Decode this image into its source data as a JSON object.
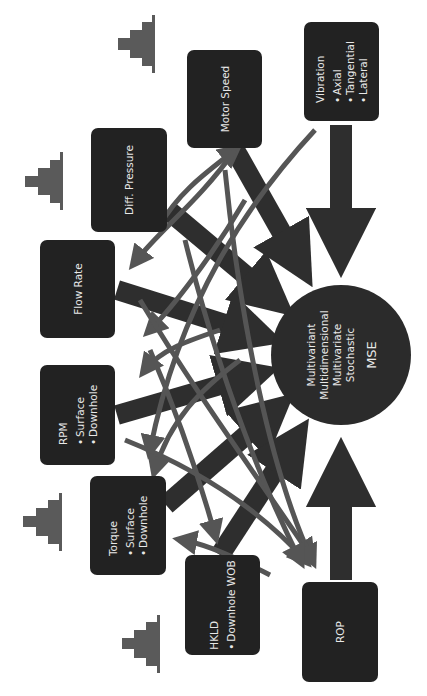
{
  "diagram": {
    "orientation": "rotated 90deg counter-clockwise",
    "center_node": {
      "lines": [
        "Multivariant",
        "Multidimensional",
        "Multivariate",
        "Stochastic"
      ],
      "title": "MSE"
    },
    "nodes": {
      "vibration": {
        "title": "Vibration",
        "items": [
          "Axial",
          "Tangential",
          "Lateral"
        ]
      },
      "motor_speed": {
        "title": "Motor Speed"
      },
      "diff_pressure": {
        "title": "Diff. Pressure"
      },
      "flow_rate": {
        "title": "Flow Rate"
      },
      "rpm": {
        "title": "RPM",
        "items": [
          "Surface",
          "Downhole"
        ]
      },
      "torque": {
        "title": "Torque",
        "items": [
          "Surface",
          "Downhole"
        ]
      },
      "hkld": {
        "title": "HKLD",
        "items": [
          "Downhole WOB"
        ]
      },
      "rop": {
        "title": "ROP"
      }
    },
    "colors": {
      "box": "#222222",
      "circle": "#2b2b2b",
      "dark_arrow": "#2e2e2e",
      "grey_arrow": "#555555",
      "pyramid_icon": "#5a5a5a",
      "text": "#e8e8e8"
    },
    "icons": [
      "bar-pyramid-icon",
      "bar-pyramid-icon",
      "bar-pyramid-icon",
      "bar-pyramid-icon"
    ]
  }
}
